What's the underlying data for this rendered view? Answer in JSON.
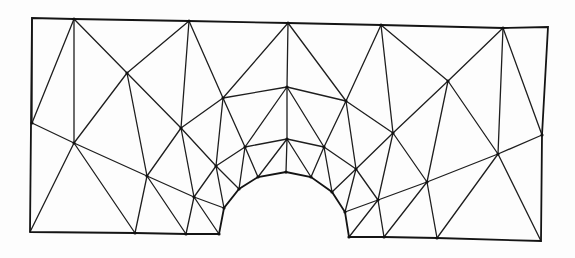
{
  "diagram": {
    "title": "Triangular finite element mesh of rectangular plate with semicircular notch",
    "colors": {
      "line": "#1e1e1e",
      "boundary": "#141414",
      "node": "#111111",
      "background": "#fdfdfd"
    },
    "nodes": {
      "c_tl": [
        32,
        18
      ],
      "t1": [
        74,
        19
      ],
      "t2": [
        189,
        21
      ],
      "t3": [
        288,
        23
      ],
      "t4": [
        381,
        25
      ],
      "t5": [
        503,
        28
      ],
      "c_tr": [
        548,
        27
      ],
      "l1": [
        32,
        123
      ],
      "c_bl": [
        30,
        232
      ],
      "b1": [
        135,
        233
      ],
      "b2": [
        186,
        234
      ],
      "a0": [
        219,
        234
      ],
      "a1": [
        224,
        208
      ],
      "a2": [
        239,
        189
      ],
      "a3": [
        258,
        177
      ],
      "a4": [
        286,
        172
      ],
      "a5": [
        311,
        177
      ],
      "a6": [
        332,
        192
      ],
      "a7": [
        345,
        212
      ],
      "a8": [
        349,
        237
      ],
      "b3": [
        384,
        237
      ],
      "b4": [
        437,
        238
      ],
      "c_br": [
        541,
        241
      ],
      "r1": [
        542,
        135
      ],
      "n1": [
        127,
        73
      ],
      "n2": [
        74,
        143
      ],
      "n3": [
        147,
        176
      ],
      "n4": [
        181,
        128
      ],
      "n5": [
        223,
        98
      ],
      "n6": [
        287,
        87
      ],
      "n7": [
        346,
        101
      ],
      "n8": [
        448,
        81
      ],
      "n9": [
        194,
        197
      ],
      "n10": [
        216,
        166
      ],
      "n11": [
        245,
        147
      ],
      "n12": [
        287,
        139
      ],
      "n13": [
        324,
        147
      ],
      "n14": [
        356,
        169
      ],
      "n15": [
        393,
        133
      ],
      "n16": [
        378,
        200
      ],
      "n17": [
        427,
        182
      ],
      "n18": [
        498,
        154
      ]
    },
    "boundary": [
      "c_bl",
      "c_tl",
      "t1",
      "t2",
      "t3",
      "t4",
      "t5",
      "c_tr",
      "r1",
      "c_br",
      "b4",
      "b3",
      "a8",
      "a7",
      "a6",
      "a5",
      "a4",
      "a3",
      "a2",
      "a1",
      "a0",
      "b2",
      "b1",
      "c_bl"
    ],
    "edges": [
      [
        "l1",
        "t1"
      ],
      [
        "t1",
        "n2"
      ],
      [
        "t1",
        "n1"
      ],
      [
        "l1",
        "n2"
      ],
      [
        "n2",
        "c_bl"
      ],
      [
        "n2",
        "b1"
      ],
      [
        "n2",
        "n1"
      ],
      [
        "n2",
        "n3"
      ],
      [
        "n1",
        "t2"
      ],
      [
        "n1",
        "n3"
      ],
      [
        "n1",
        "n4"
      ],
      [
        "t2",
        "n4"
      ],
      [
        "t2",
        "n5"
      ],
      [
        "n4",
        "n5"
      ],
      [
        "n4",
        "n3"
      ],
      [
        "n4",
        "n9"
      ],
      [
        "n4",
        "n10"
      ],
      [
        "n3",
        "b1"
      ],
      [
        "n3",
        "b2"
      ],
      [
        "n3",
        "n9"
      ],
      [
        "n9",
        "b2"
      ],
      [
        "n9",
        "a0"
      ],
      [
        "n9",
        "a1"
      ],
      [
        "n9",
        "n10"
      ],
      [
        "n5",
        "t3"
      ],
      [
        "n5",
        "n6"
      ],
      [
        "n5",
        "n11"
      ],
      [
        "n5",
        "n10"
      ],
      [
        "n10",
        "n11"
      ],
      [
        "n10",
        "a2"
      ],
      [
        "n10",
        "a1"
      ],
      [
        "n11",
        "a2"
      ],
      [
        "n11",
        "a3"
      ],
      [
        "n11",
        "n12"
      ],
      [
        "n11",
        "n6"
      ],
      [
        "t3",
        "n6"
      ],
      [
        "t3",
        "n7"
      ],
      [
        "n6",
        "n12"
      ],
      [
        "n6",
        "n7"
      ],
      [
        "n6",
        "n13"
      ],
      [
        "n12",
        "a3"
      ],
      [
        "n12",
        "a4"
      ],
      [
        "n12",
        "a5"
      ],
      [
        "n12",
        "n13"
      ],
      [
        "n13",
        "n7"
      ],
      [
        "n13",
        "a5"
      ],
      [
        "n13",
        "a6"
      ],
      [
        "n13",
        "n14"
      ],
      [
        "n7",
        "n14"
      ],
      [
        "n7",
        "t4"
      ],
      [
        "t4",
        "n15"
      ],
      [
        "t4",
        "n8"
      ],
      [
        "n7",
        "n15"
      ],
      [
        "n15",
        "n14"
      ],
      [
        "n15",
        "n16"
      ],
      [
        "n15",
        "n8"
      ],
      [
        "n15",
        "n17"
      ],
      [
        "n14",
        "a6"
      ],
      [
        "n14",
        "a7"
      ],
      [
        "n14",
        "n16"
      ],
      [
        "n16",
        "a7"
      ],
      [
        "n16",
        "a8"
      ],
      [
        "n16",
        "b3"
      ],
      [
        "n16",
        "n17"
      ],
      [
        "n17",
        "b3"
      ],
      [
        "n17",
        "b4"
      ],
      [
        "n17",
        "n8"
      ],
      [
        "n17",
        "n18"
      ],
      [
        "n8",
        "t5"
      ],
      [
        "n8",
        "n18"
      ],
      [
        "t5",
        "n18"
      ],
      [
        "t5",
        "r1"
      ],
      [
        "n18",
        "r1"
      ],
      [
        "n18",
        "b4"
      ],
      [
        "n18",
        "c_br"
      ],
      [
        "l1",
        "c_tl"
      ]
    ]
  }
}
